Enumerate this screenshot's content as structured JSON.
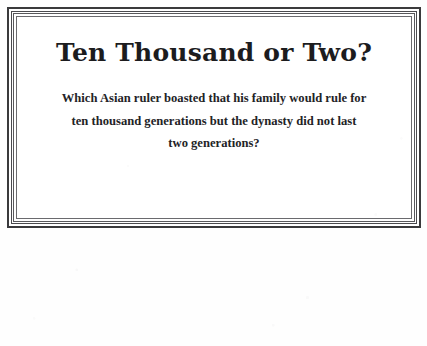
{
  "card": {
    "title": "Ten Thousand or Two?",
    "question_lines": [
      "Which Asian ruler boasted that his family would rule for",
      "ten thousand generations but the dynasty did not last",
      "two generations?"
    ],
    "question_full": "Which Asian ruler boasted that his family would rule for ten thousand generations but the dynasty did not last two generations?"
  },
  "colors": {
    "page_background": "#ffffff",
    "card_background": "#ffffff",
    "frame_outer_rule": "#3a3a3c",
    "frame_middle_rule": "#4a4a4e",
    "frame_inner_rule": "#6a6a6e",
    "title_text": "#1c1c1e",
    "question_text": "#232326"
  }
}
